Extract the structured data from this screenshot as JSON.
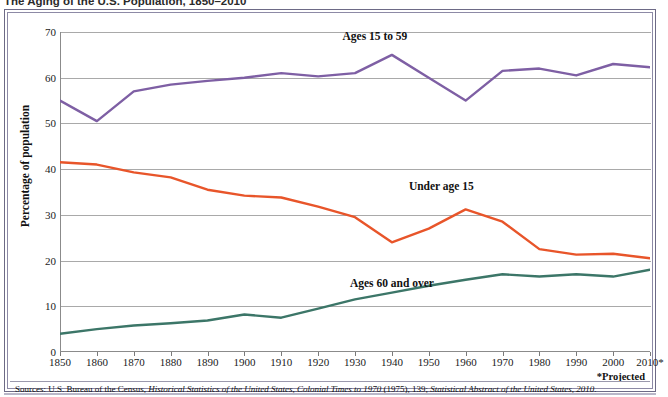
{
  "figure": {
    "title": "The Aging of the U.S. Population, 1850–2010",
    "projected_note": "*Projected",
    "source_prefix": "Sources: U.S. Bureau of the Census, ",
    "source_italic_1": "Historical Statistics of the United States, Colonial Times to 1970",
    "source_mid": " (1975), 139; ",
    "source_italic_2": "Statistical Abstract of the United States, 2010",
    "source_suffix": "."
  },
  "chart_data": {
    "type": "line",
    "title": "The Aging of the U.S. Population, 1850–2010",
    "xlabel": "",
    "ylabel": "Percentage of population",
    "xlim": [
      1850,
      2010
    ],
    "ylim": [
      0,
      70
    ],
    "ytick_step": 10,
    "grid": true,
    "legend_position": "inline-annotations",
    "x": [
      1850,
      1860,
      1870,
      1880,
      1890,
      1900,
      1910,
      1920,
      1930,
      1940,
      1950,
      1960,
      1970,
      1980,
      1990,
      2000,
      2010
    ],
    "xtick_labels": [
      "1850",
      "1860",
      "1870",
      "1880",
      "1890",
      "1900",
      "1910",
      "1920",
      "1930",
      "1940",
      "1950",
      "1960",
      "1970",
      "1980",
      "1990",
      "2000",
      "2010*"
    ],
    "ytick_labels": [
      "0",
      "10",
      "20",
      "30",
      "40",
      "50",
      "60",
      "70"
    ],
    "ytick_values": [
      0,
      10,
      20,
      30,
      40,
      50,
      60,
      70
    ],
    "series": [
      {
        "name": "Ages 15 to 59",
        "color": "#7e5fa4",
        "label_x": 1938,
        "label_y": 69.0,
        "values": [
          55.0,
          50.5,
          57.0,
          58.5,
          59.3,
          60.0,
          61.0,
          60.3,
          61.0,
          65.0,
          60.0,
          55.0,
          61.5,
          62.0,
          60.5,
          63.0,
          62.3
        ]
      },
      {
        "name": "Under age 15",
        "color": "#e8552a",
        "label_x": 1956,
        "label_y": 36.2,
        "values": [
          41.5,
          41.0,
          39.3,
          38.2,
          35.5,
          34.2,
          33.8,
          31.8,
          29.5,
          24.0,
          27.0,
          31.2,
          28.5,
          22.5,
          21.3,
          21.5,
          20.5
        ]
      },
      {
        "name": "Ages 60 and over",
        "color": "#3c7668",
        "label_x": 1940,
        "label_y": 14.8,
        "values": [
          4.0,
          5.0,
          5.8,
          6.3,
          6.9,
          8.2,
          7.5,
          9.5,
          11.5,
          13.0,
          14.5,
          15.8,
          17.0,
          16.5,
          17.0,
          16.5,
          18.0
        ]
      }
    ]
  }
}
